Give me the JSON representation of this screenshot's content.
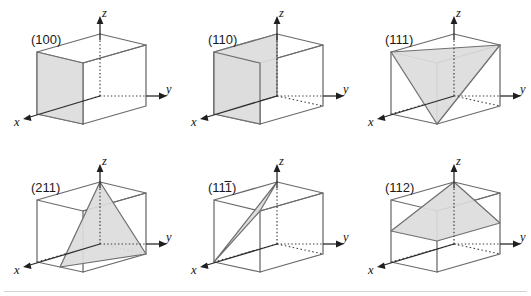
{
  "figure": {
    "background_color": "#ffffff",
    "plane_fill_color": "#dcdcdc",
    "edge_color": "#6a6a6a",
    "axis_color": "#1f1f1f",
    "rows": 2,
    "columns": 3
  },
  "axes": {
    "x_label": "x",
    "y_label": "y",
    "z_label": "z"
  },
  "panels": [
    {
      "id": "panel-100",
      "label": "(100)",
      "miller_indices": [
        1,
        0,
        0
      ],
      "overbar_positions": [],
      "plane_shape": "square-face",
      "description": "Front face perpendicular to x",
      "position": {
        "left": 0,
        "top": 0
      }
    },
    {
      "id": "panel-110",
      "label": "(110)",
      "miller_indices": [
        1,
        1,
        0
      ],
      "overbar_positions": [],
      "plane_shape": "diagonal-parallelogram",
      "description": "Vertical diagonal plane through x and y intercepts",
      "position": {
        "left": 177,
        "top": 0
      }
    },
    {
      "id": "panel-111",
      "label": "(111)",
      "miller_indices": [
        1,
        1,
        1
      ],
      "overbar_positions": [],
      "plane_shape": "corner-triangle",
      "description": "Triangle joining unit intercepts on x, y and z",
      "position": {
        "left": 354,
        "top": 0
      }
    },
    {
      "id": "panel-211",
      "label": "(211)",
      "miller_indices": [
        2,
        1,
        1
      ],
      "overbar_positions": [],
      "plane_shape": "half-x-triangle",
      "description": "Triangle with x intercept at one half",
      "position": {
        "left": 0,
        "top": 148
      }
    },
    {
      "id": "panel-1bar11",
      "label": "(111)",
      "miller_indices": [
        1,
        -1,
        1
      ],
      "overbar_positions": [
        1
      ],
      "plane_shape": "negative-y-triangle",
      "description": "Triangle with negative y intercept",
      "position": {
        "left": 177,
        "top": 148
      }
    },
    {
      "id": "panel-112",
      "label": "(112)",
      "miller_indices": [
        1,
        1,
        2
      ],
      "overbar_positions": [],
      "plane_shape": "half-z-quadrilateral",
      "description": "Plane with z intercept at one half",
      "position": {
        "left": 354,
        "top": 148
      }
    }
  ]
}
